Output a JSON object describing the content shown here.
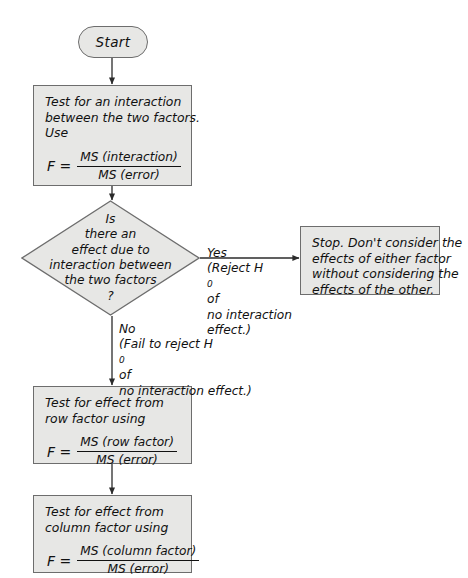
{
  "diagram": {
    "background_color": "#ffffff",
    "node_fill_color": "#e7e7e5",
    "node_border_color": "#6d6d6d",
    "connector_color": "#2b2b2b",
    "text_color": "#111111"
  },
  "start": {
    "label": "Start"
  },
  "interaction_test": {
    "line1_a": "Test for an ",
    "line1_b": "interaction",
    "line2": "between the two factors.",
    "line3": "Use",
    "formula_lhs": "F =",
    "formula_numerator": "MS (interaction)",
    "formula_denominator": "MS (error)"
  },
  "decision": {
    "line1": "Is",
    "line2": "there an",
    "line3": "effect due to",
    "line4": "interaction between",
    "line5": "the two factors",
    "line6": "?"
  },
  "yes_branch": {
    "answer": "Yes",
    "note_line1_a": "(Reject H",
    "note_line1_sub": "0",
    "note_line1_b": " of",
    "note_line2": "no interaction",
    "note_line3": "effect.)"
  },
  "no_branch": {
    "answer": "No",
    "note_line1_a": "(Fail to reject H",
    "note_line1_sub": "0",
    "note_line1_b": " of",
    "note_line2": "no interaction effect.)"
  },
  "stop_node": {
    "line1": "Stop. Don't consider the",
    "line2": "effects of either factor",
    "line3": "without considering the",
    "line4": "effects of the other."
  },
  "row_factor_test": {
    "line1": "Test for effect from",
    "line2": "row factor using",
    "formula_lhs": "F =",
    "formula_numerator": "MS (row factor)",
    "formula_denominator": "MS (error)"
  },
  "column_factor_test": {
    "line1": "Test for effect from",
    "line2": "column factor using",
    "formula_lhs": "F =",
    "formula_numerator": "MS (column factor)",
    "formula_denominator": "MS (error)"
  }
}
